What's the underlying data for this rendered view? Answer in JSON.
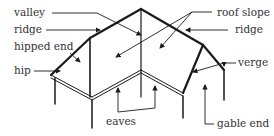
{
  "diagram": {
    "labels": {
      "valley": "valley",
      "ridge_left": "ridge",
      "hipped_end": "hipped end",
      "hip": "hip",
      "roof_slope": "roof slope",
      "ridge_right": "ridge",
      "verge": "verge",
      "eaves": "eaves",
      "gable_end": "gable end"
    },
    "colors": {
      "line": "#1a1a1a",
      "text": "#333333",
      "background": "#ffffff"
    }
  }
}
